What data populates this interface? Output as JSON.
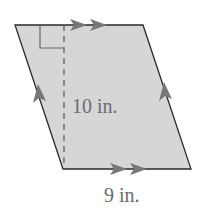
{
  "figure": {
    "shape": "parallelogram",
    "fill_color": "#d6d6d6",
    "edge_color": "#2a2a2a",
    "marker_color": "#777777",
    "height_label": "10 in.",
    "base_label": "9 in.",
    "markings": {
      "top_and_bottom": "double-arrow (parallel)",
      "left_and_right": "single-arrow (parallel)",
      "right_angle": true,
      "dashed_height": true
    }
  }
}
